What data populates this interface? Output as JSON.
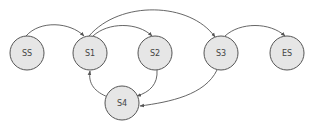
{
  "diagram": {
    "type": "state-graph",
    "colors": {
      "node_fill": "#e6e6e6",
      "node_stroke": "#555555",
      "edge": "#555555",
      "label": "#444444",
      "background": "#ffffff"
    },
    "nodes": [
      {
        "id": "SS",
        "label": "SS",
        "cx": 27,
        "cy": 53,
        "r": 17
      },
      {
        "id": "S1",
        "label": "S1",
        "cx": 90,
        "cy": 53,
        "r": 17
      },
      {
        "id": "S2",
        "label": "S2",
        "cx": 155,
        "cy": 53,
        "r": 17
      },
      {
        "id": "S3",
        "label": "S3",
        "cx": 221,
        "cy": 53,
        "r": 17
      },
      {
        "id": "ES",
        "label": "ES",
        "cx": 287,
        "cy": 53,
        "r": 17
      },
      {
        "id": "S4",
        "label": "S4",
        "cx": 122,
        "cy": 103,
        "r": 17
      }
    ],
    "edges": [
      {
        "from": "SS",
        "to": "S1"
      },
      {
        "from": "S1",
        "to": "S2"
      },
      {
        "from": "S1",
        "to": "S3"
      },
      {
        "from": "S3",
        "to": "ES"
      },
      {
        "from": "S2",
        "to": "S4"
      },
      {
        "from": "S4",
        "to": "S1"
      },
      {
        "from": "S3",
        "to": "S4"
      }
    ]
  }
}
